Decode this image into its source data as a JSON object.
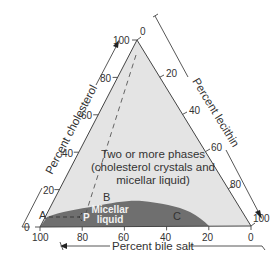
{
  "diagram": {
    "type": "ternary-phase-diagram",
    "colors": {
      "two_phase_fill": "#e4e4e4",
      "micellar_fill": "#6f6f6f",
      "outline": "#444444",
      "text": "#333333",
      "micellar_text": "#f2f2f2"
    },
    "axes": {
      "cholesterol": {
        "title": "Percent cholesterol",
        "ticks": [
          "0",
          "20",
          "40",
          "60",
          "80",
          "100"
        ]
      },
      "lecithin": {
        "title": "Percent lecithin",
        "ticks": [
          "0",
          "20",
          "40",
          "60",
          "80",
          "100"
        ]
      },
      "bile_salt": {
        "title": "Percent bile salt",
        "ticks": [
          "100",
          "80",
          "60",
          "40",
          "20",
          "0"
        ]
      }
    },
    "regions": {
      "two_phase": {
        "line1": "Two or more phases",
        "line2": "(cholesterol crystals and",
        "line3": "micellar liquid)"
      },
      "micellar": {
        "line1": "Micellar",
        "line2": "liquid"
      }
    },
    "points": {
      "A": "A",
      "B": "B",
      "C": "C",
      "P": "P"
    }
  }
}
